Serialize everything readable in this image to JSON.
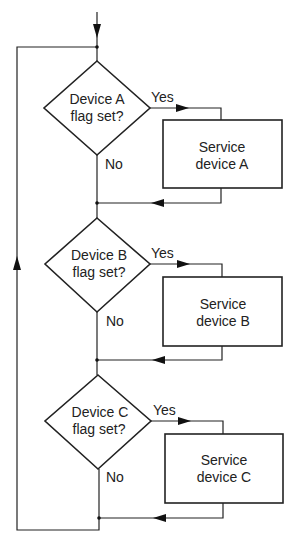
{
  "diagram": {
    "type": "flowchart",
    "decisions": [
      {
        "id": "A",
        "line1": "Device A",
        "line2": "flag set?",
        "yes": "Yes",
        "no": "No"
      },
      {
        "id": "B",
        "line1": "Device B",
        "line2": "flag set?",
        "yes": "Yes",
        "no": "No"
      },
      {
        "id": "C",
        "line1": "Device C",
        "line2": "flag set?",
        "yes": "Yes",
        "no": "No"
      }
    ],
    "processes": [
      {
        "id": "A",
        "line1": "Service",
        "line2": "device A"
      },
      {
        "id": "B",
        "line1": "Service",
        "line2": "device B"
      },
      {
        "id": "C",
        "line1": "Service",
        "line2": "device C"
      }
    ],
    "colors": {
      "stroke": "#222222",
      "background": "#ffffff"
    }
  }
}
